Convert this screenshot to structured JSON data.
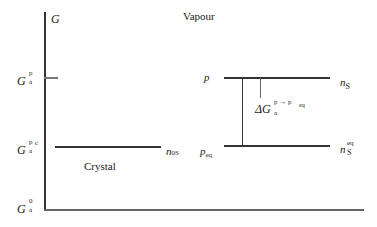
{
  "diagram": {
    "axis": {
      "y_label": "G",
      "ticks": [
        {
          "id": "Gap",
          "main": "G",
          "sup": "p",
          "sub": "a"
        },
        {
          "id": "Gapc",
          "main": "G",
          "sup": "p",
          "sup2": "c",
          "sub": "a"
        },
        {
          "id": "Ga0",
          "main": "G",
          "sup": "0",
          "sub": "a"
        }
      ]
    },
    "regions": {
      "vapour": "Vapour",
      "crystal": "Crystal"
    },
    "levels": {
      "crystal": {
        "right_label": "n",
        "right_sub": "0S"
      },
      "p": {
        "left_label": "p",
        "right_label": "n",
        "right_sub": "S"
      },
      "peq": {
        "left_label": "p",
        "left_sub": "eq",
        "right_label": "n",
        "right_sub": "S",
        "right_sup": "eq"
      }
    },
    "delta": {
      "main": "ΔG",
      "sub": "a",
      "sup": "p → p",
      "sup_sub": "eq"
    },
    "colors": {
      "line": "#333333",
      "tick": "#777777",
      "text": "#1a1a1a"
    }
  }
}
